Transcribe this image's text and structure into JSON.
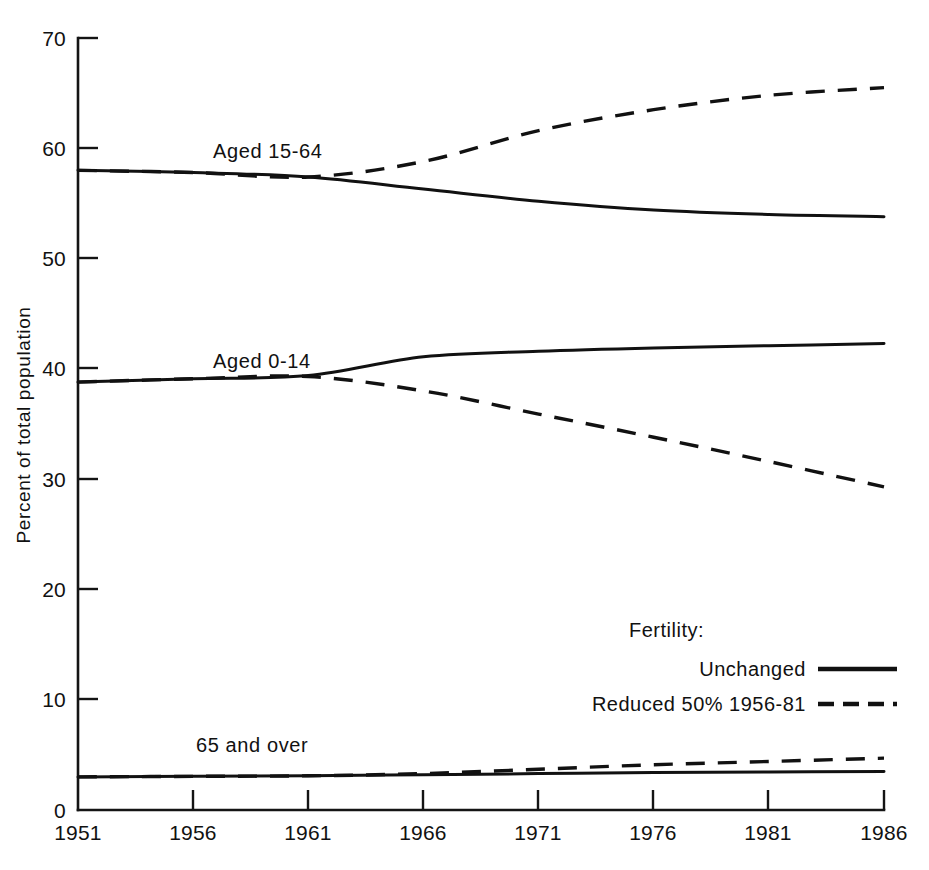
{
  "chart_data": {
    "type": "line",
    "title": "",
    "subtitle": "",
    "xlabel": "",
    "ylabel": "Percent of total population",
    "xlim": [
      1951,
      1986
    ],
    "ylim": [
      0,
      70
    ],
    "grid": false,
    "x_ticks": [
      "1951",
      "1956",
      "1961",
      "1966",
      "1971",
      "1976",
      "1981",
      "1986"
    ],
    "x_tick_values": [
      1951,
      1956,
      1961,
      1966,
      1971,
      1976,
      1981,
      1986
    ],
    "y_ticks": [
      "0",
      "10",
      "20",
      "30",
      "40",
      "50",
      "60",
      "70"
    ],
    "y_tick_values": [
      0,
      10,
      20,
      30,
      40,
      50,
      60,
      70
    ],
    "legend_position": "inside-lower-right",
    "legend_title": "Fertility:",
    "legend": [
      "Unchanged",
      "Reduced 50% 1956-81"
    ],
    "annotations": [
      "Aged 15-64",
      "Aged 0-14",
      "65 and over"
    ],
    "x": [
      1951,
      1956,
      1961,
      1966,
      1971,
      1976,
      1981,
      1986
    ],
    "series": [
      {
        "name": "Aged 15-64 — Unchanged",
        "group": "Aged 15-64",
        "scenario": "Unchanged",
        "style": "solid",
        "values": [
          58.0,
          57.8,
          57.4,
          56.3,
          55.2,
          54.4,
          54.0,
          53.8
        ]
      },
      {
        "name": "Aged 15-64 — Reduced 50% 1956-81",
        "group": "Aged 15-64",
        "scenario": "Reduced 50% 1956-81",
        "style": "dashed",
        "values": [
          58.0,
          57.8,
          57.4,
          58.8,
          61.6,
          63.5,
          64.8,
          65.5
        ]
      },
      {
        "name": "Aged 0-14 — Unchanged",
        "group": "Aged 0-14",
        "scenario": "Unchanged",
        "style": "solid",
        "values": [
          38.8,
          39.1,
          39.4,
          41.1,
          41.6,
          41.9,
          42.1,
          42.3
        ]
      },
      {
        "name": "Aged 0-14 — Reduced 50% 1956-81",
        "group": "Aged 0-14",
        "scenario": "Reduced 50% 1956-81",
        "style": "dashed",
        "values": [
          38.8,
          39.1,
          39.3,
          38.0,
          35.9,
          33.8,
          31.6,
          29.3
        ]
      },
      {
        "name": "65 and over — Unchanged",
        "group": "65 and over",
        "scenario": "Unchanged",
        "style": "solid",
        "values": [
          3.0,
          3.05,
          3.1,
          3.2,
          3.3,
          3.4,
          3.45,
          3.5
        ]
      },
      {
        "name": "65 and over — Reduced 50% 1956-81",
        "group": "65 and over",
        "scenario": "Reduced 50% 1956-81",
        "style": "dashed",
        "values": [
          3.0,
          3.05,
          3.1,
          3.3,
          3.7,
          4.1,
          4.4,
          4.7
        ]
      }
    ]
  },
  "labels": {
    "aged_15_64": "Aged 15-64",
    "aged_0_14": "Aged 0-14",
    "aged_65_over": "65 and over"
  },
  "legend": {
    "title": "Fertility:",
    "unchanged": "Unchanged",
    "reduced": "Reduced 50% 1956-81"
  },
  "axes": {
    "y_title": "Percent of total population",
    "y_ticks": [
      "70",
      "60",
      "50",
      "40",
      "30",
      "20",
      "10",
      "0"
    ],
    "x_ticks": [
      "1951",
      "1956",
      "1961",
      "1966",
      "1971",
      "1976",
      "1981",
      "1986"
    ]
  },
  "colors": {
    "ink": "#111111",
    "background": "#ffffff"
  }
}
